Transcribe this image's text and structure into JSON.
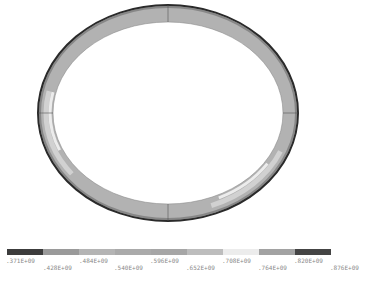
{
  "contour_plot": {
    "shape": "elliptical ring cross-section",
    "legend": {
      "segments": [
        {
          "color": "#3c3c3c"
        },
        {
          "color": "#9a9a9a"
        },
        {
          "color": "#b4b4b4"
        },
        {
          "color": "#aaaaaa"
        },
        {
          "color": "#a6a6a6"
        },
        {
          "color": "#bdbdbd"
        },
        {
          "color": "#ececec"
        },
        {
          "color": "#a2a2a2"
        },
        {
          "color": "#444444"
        }
      ],
      "labels": [
        ".371E+09",
        ".428E+09",
        ".484E+09",
        ".540E+09",
        ".596E+09",
        ".652E+09",
        ".708E+09",
        ".764E+09",
        ".820E+09",
        ".876E+09"
      ]
    }
  }
}
